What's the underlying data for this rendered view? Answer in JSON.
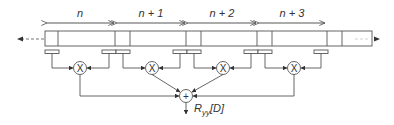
{
  "diagram": {
    "type": "block-diagram",
    "colors": {
      "stroke": "#555555",
      "text": "#333333",
      "dashed": "#888888"
    },
    "segments": [
      {
        "label": "n"
      },
      {
        "label": "n + 1"
      },
      {
        "label": "n + 2"
      },
      {
        "label": "n + 3"
      }
    ],
    "multiplier_symbol": "X",
    "adder_symbol": "+",
    "output": {
      "label_main": "R",
      "label_sub": "yy",
      "label_tail": "[D]"
    },
    "input_arrow": "left-dashed-arrow",
    "output_arrow": "right-dashed-arrow"
  }
}
